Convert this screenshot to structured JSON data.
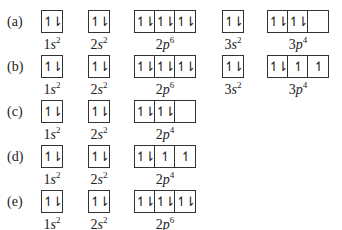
{
  "arrow_glyphs": {
    "pair": "↿⇂",
    "single": "↿",
    "empty": ""
  },
  "rows": [
    {
      "label": "(a)",
      "orbitals": [
        {
          "name": "1s",
          "n": "1",
          "l": "s",
          "electrons": "2",
          "boxes": [
            "pair"
          ]
        },
        {
          "name": "2s",
          "n": "2",
          "l": "s",
          "electrons": "2",
          "boxes": [
            "pair"
          ]
        },
        {
          "name": "2p",
          "n": "2",
          "l": "p",
          "electrons": "6",
          "boxes": [
            "pair",
            "pair",
            "pair"
          ]
        },
        {
          "name": "3s",
          "n": "3",
          "l": "s",
          "electrons": "2",
          "boxes": [
            "pair"
          ]
        },
        {
          "name": "3p",
          "n": "3",
          "l": "p",
          "electrons": "4",
          "boxes": [
            "pair",
            "pair",
            "empty"
          ]
        }
      ]
    },
    {
      "label": "(b)",
      "orbitals": [
        {
          "name": "1s",
          "n": "1",
          "l": "s",
          "electrons": "2",
          "boxes": [
            "pair"
          ]
        },
        {
          "name": "2s",
          "n": "2",
          "l": "s",
          "electrons": "2",
          "boxes": [
            "pair"
          ]
        },
        {
          "name": "2p",
          "n": "2",
          "l": "p",
          "electrons": "6",
          "boxes": [
            "pair",
            "pair",
            "pair"
          ]
        },
        {
          "name": "3s",
          "n": "3",
          "l": "s",
          "electrons": "2",
          "boxes": [
            "pair"
          ]
        },
        {
          "name": "3p",
          "n": "3",
          "l": "p",
          "electrons": "4",
          "boxes": [
            "pair",
            "single",
            "single"
          ]
        }
      ]
    },
    {
      "label": "(c)",
      "orbitals": [
        {
          "name": "1s",
          "n": "1",
          "l": "s",
          "electrons": "2",
          "boxes": [
            "pair"
          ]
        },
        {
          "name": "2s",
          "n": "2",
          "l": "s",
          "electrons": "2",
          "boxes": [
            "pair"
          ]
        },
        {
          "name": "2p",
          "n": "2",
          "l": "p",
          "electrons": "4",
          "boxes": [
            "pair",
            "pair",
            "empty"
          ]
        }
      ]
    },
    {
      "label": "(d)",
      "orbitals": [
        {
          "name": "1s",
          "n": "1",
          "l": "s",
          "electrons": "2",
          "boxes": [
            "pair"
          ]
        },
        {
          "name": "2s",
          "n": "2",
          "l": "s",
          "electrons": "2",
          "boxes": [
            "pair"
          ]
        },
        {
          "name": "2p",
          "n": "2",
          "l": "p",
          "electrons": "4",
          "boxes": [
            "pair",
            "single",
            "single"
          ]
        }
      ]
    },
    {
      "label": "(e)",
      "orbitals": [
        {
          "name": "1s",
          "n": "1",
          "l": "s",
          "electrons": "2",
          "boxes": [
            "pair"
          ]
        },
        {
          "name": "2s",
          "n": "2",
          "l": "s",
          "electrons": "2",
          "boxes": [
            "pair"
          ]
        },
        {
          "name": "2p",
          "n": "2",
          "l": "p",
          "electrons": "6",
          "boxes": [
            "pair",
            "pair",
            "pair"
          ]
        }
      ]
    }
  ],
  "layout": {
    "row_top": [
      5,
      50,
      95,
      140,
      185
    ],
    "col_left": [
      41,
      88,
      134,
      222,
      267
    ]
  }
}
